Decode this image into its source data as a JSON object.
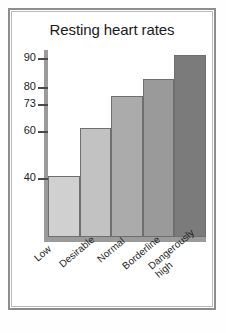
{
  "chart_data": {
    "type": "bar",
    "title": "Resting heart rates",
    "xlabel": "",
    "ylabel": "",
    "categories": [
      "Low",
      "Desirable",
      "Normal",
      "Borderline",
      "Dangerously high"
    ],
    "values": [
      40,
      60,
      73,
      80,
      90
    ],
    "ytick_labels": [
      "90",
      "80",
      "73",
      "60",
      "40"
    ],
    "ytick_values": [
      90,
      80,
      73,
      60,
      40
    ],
    "ylim": [
      15,
      92
    ],
    "grid": false,
    "legend": false,
    "bar_colors": [
      "#d0d0d0",
      "#c2c2c2",
      "#ababab",
      "#9a9a9a",
      "#7b7b7b"
    ],
    "bar_edge_color": "#6f6f6f",
    "axis_color": "#9b9b9b",
    "frame_color": "#8d8d8d",
    "background": "#ffffff",
    "label_rotation_degrees": -40
  },
  "axis": {
    "ticks": [
      {
        "label": "90",
        "value": 90
      },
      {
        "label": "80",
        "value": 80
      },
      {
        "label": "73",
        "value": 73
      },
      {
        "label": "60",
        "value": 60
      },
      {
        "label": "40",
        "value": 40
      }
    ]
  },
  "categories": [
    {
      "label": "Low",
      "value": 40
    },
    {
      "label": "Desirable",
      "value": 60
    },
    {
      "label": "Normal",
      "value": 73
    },
    {
      "label": "Borderline",
      "value": 80
    },
    {
      "label": "Dangerously high",
      "value": 90
    }
  ]
}
